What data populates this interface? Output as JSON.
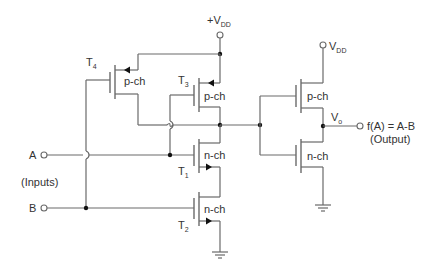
{
  "diagram": {
    "supply": {
      "top_label_prefix": "+V",
      "top_label_sub": "DD",
      "right_label_prefix": "V",
      "right_label_sub": "DD"
    },
    "transistors": [
      {
        "id": "T4",
        "name": "T",
        "sub": "4",
        "type": "p-ch"
      },
      {
        "id": "T3",
        "name": "T",
        "sub": "3",
        "type": "p-ch"
      },
      {
        "id": "T1",
        "name": "T",
        "sub": "1",
        "type": "n-ch"
      },
      {
        "id": "T2",
        "name": "T",
        "sub": "2",
        "type": "n-ch"
      },
      {
        "id": "inv_p",
        "type": "p-ch"
      },
      {
        "id": "inv_n",
        "type": "n-ch"
      }
    ],
    "inputs": {
      "a_label": "A",
      "b_label": "B",
      "group_label": "(Inputs)"
    },
    "output": {
      "node_prefix": "V",
      "node_sub": "o",
      "function": "f(A) = A-B",
      "caption": "(Output)"
    },
    "colors": {
      "wire": "#6a6a6a",
      "junction": "#111111",
      "text": "#333333",
      "background": "#ffffff"
    }
  }
}
